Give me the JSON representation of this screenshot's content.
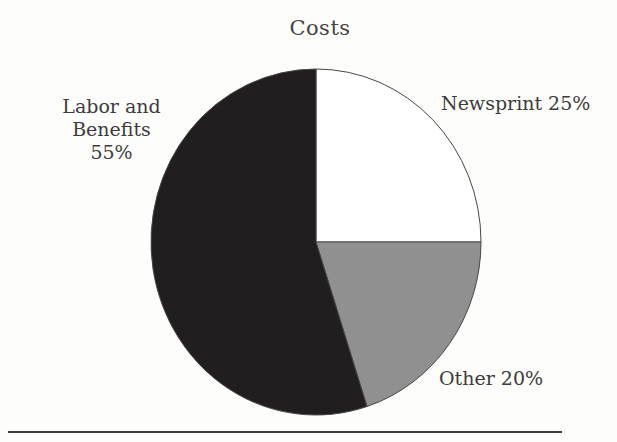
{
  "figure": {
    "title": "Costs"
  },
  "chart_data": {
    "type": "pie",
    "title": "Costs",
    "units": "%",
    "start_angle_deg": 0,
    "direction": "clockwise",
    "legend_position": "none",
    "label_placement": "outside",
    "slices": [
      {
        "label": "Newsprint",
        "value": 25,
        "display_label": "Newsprint 25%",
        "color": "#ffffff"
      },
      {
        "label": "Other",
        "value": 20,
        "display_label": "Other 20%",
        "color": "#919090"
      },
      {
        "label": "Labor and Benefits",
        "value": 55,
        "display_label": "Labor and Benefits 55%",
        "color": "#201e1e"
      }
    ]
  },
  "labels": {
    "labor_line1": "Labor and Benefits",
    "labor_line2": "55%",
    "newsprint": "Newsprint 25%",
    "other": "Other 20%"
  },
  "colors": {
    "background": "#fdfdfb",
    "text": "#3d3b3b",
    "slice_outline": "#4a4847",
    "rule": "#3b3a3a"
  }
}
